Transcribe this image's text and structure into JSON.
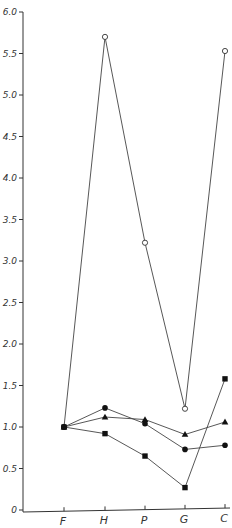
{
  "chart_data": {
    "type": "line",
    "title": "",
    "xlabel": "",
    "ylabel": "",
    "categories": [
      "F",
      "H",
      "P",
      "G",
      "C"
    ],
    "ylim": [
      0,
      6.0
    ],
    "yticks": [
      0,
      0.5,
      1.0,
      1.5,
      2.0,
      2.5,
      3.0,
      3.5,
      4.0,
      4.5,
      5.0,
      5.5,
      6.0
    ],
    "ytick_labels": [
      "0",
      "0,5",
      "1,0",
      "1,5",
      "2,0",
      "2,5",
      "3,0",
      "3,5",
      "4,0",
      "4,5",
      "5,0",
      "5,5",
      "6,0"
    ],
    "grid": false,
    "legend": null,
    "series": [
      {
        "name": "open circle",
        "marker": "open-circle",
        "values": [
          1.0,
          5.7,
          3.22,
          1.22,
          5.53
        ]
      },
      {
        "name": "filled circle",
        "marker": "filled-circle",
        "values": [
          1.0,
          1.23,
          1.04,
          0.73,
          0.78
        ]
      },
      {
        "name": "filled triangle",
        "marker": "filled-triangle",
        "values": [
          1.0,
          1.12,
          1.09,
          0.91,
          1.06
        ]
      },
      {
        "name": "filled square",
        "marker": "filled-square",
        "values": [
          1.0,
          0.92,
          0.65,
          0.27,
          1.58
        ]
      }
    ]
  }
}
